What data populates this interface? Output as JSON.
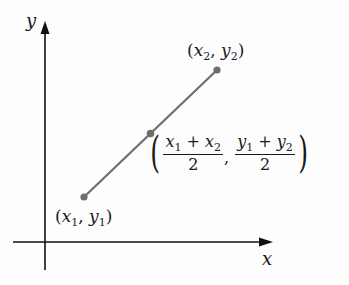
{
  "diagram": {
    "axes": {
      "x_label": "x",
      "y_label": "y"
    },
    "points": {
      "p1": {
        "label_x": "x",
        "label_x_sub": "1",
        "label_y": "y",
        "label_y_sub": "1"
      },
      "p2": {
        "label_x": "x",
        "label_x_sub": "2",
        "label_y": "y",
        "label_y_sub": "2"
      },
      "midpoint": {
        "x_num_a": "x",
        "x_num_a_sub": "1",
        "x_num_op": "+",
        "x_num_b": "x",
        "x_num_b_sub": "2",
        "x_den": "2",
        "y_num_a": "y",
        "y_num_a_sub": "1",
        "y_num_op": "+",
        "y_num_b": "y",
        "y_num_b_sub": "2",
        "y_den": "2"
      }
    },
    "colors": {
      "axis": "#111111",
      "segment": "#6e6e6e",
      "point": "#6e6e6e",
      "text": "#1a1a1a"
    },
    "punct": {
      "open": "(",
      "close": ")",
      "comma": ","
    }
  }
}
